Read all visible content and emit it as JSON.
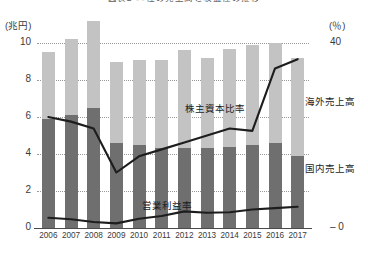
{
  "title": "図表2 ○○社の売上高と収益性の推移",
  "axes": {
    "left_unit": "(兆円)",
    "right_unit": "(％)",
    "left_ticks": [
      "10",
      "8",
      "6",
      "4",
      "2",
      "0"
    ],
    "right_ticks": [
      "40",
      "0"
    ],
    "left_range": [
      0,
      10
    ],
    "right_range": [
      0,
      40
    ]
  },
  "annotations": {
    "equity_ratio": "株主資本比率",
    "operating_margin": "営業利益率",
    "overseas_sales": "海外売上高",
    "domestic_sales": "国内売上高"
  },
  "colors": {
    "domestic_bar": "#6f6f6f",
    "overseas_bar": "#c3c3c3",
    "line": "#1d1d1d",
    "grid": "#9a9a9a",
    "axis": "#4a4a4a",
    "text": "#3a3a3a"
  },
  "chart_data": {
    "type": "bar",
    "title": "図表2 ○○社の売上高と収益性の推移",
    "xlabel": "",
    "ylabel": "兆円",
    "y2label": "％",
    "ylim": [
      0,
      10
    ],
    "y2lim": [
      0,
      40
    ],
    "grid": true,
    "legend": "inline-labels",
    "categories": [
      "2006",
      "2007",
      "2008",
      "2009",
      "2010",
      "2011",
      "2012",
      "2013",
      "2014",
      "2015",
      "2016",
      "2017"
    ],
    "series": [
      {
        "name": "国内売上高",
        "type": "bar",
        "stack": "sales",
        "axis": "left",
        "unit": "兆円",
        "color": "#6f6f6f",
        "values": [
          5.9,
          6.1,
          6.5,
          4.6,
          4.5,
          4.3,
          4.3,
          4.3,
          4.4,
          4.5,
          4.6,
          3.9
        ]
      },
      {
        "name": "海外売上高",
        "type": "bar",
        "stack": "sales",
        "axis": "left",
        "unit": "兆円",
        "color": "#c3c3c3",
        "values": [
          3.6,
          4.1,
          4.7,
          4.4,
          4.6,
          4.8,
          5.3,
          4.9,
          5.3,
          5.4,
          5.4,
          5.3
        ]
      },
      {
        "name": "株主資本比率",
        "type": "line",
        "axis": "right",
        "unit": "％",
        "color": "#1d1d1d",
        "values": [
          24.0,
          23.0,
          21.5,
          12.0,
          15.5,
          17.0,
          18.5,
          20.0,
          21.5,
          21.0,
          34.5,
          36.5
        ]
      },
      {
        "name": "営業利益率",
        "type": "line",
        "axis": "right",
        "unit": "％",
        "color": "#1d1d1d",
        "values": [
          2.2,
          1.9,
          1.3,
          1.0,
          2.0,
          2.6,
          3.6,
          3.3,
          3.4,
          4.0,
          4.3,
          4.6
        ]
      }
    ],
    "totals": [
      9.5,
      10.2,
      11.2,
      9.0,
      9.1,
      9.1,
      9.6,
      9.2,
      9.7,
      9.9,
      10.0,
      9.2
    ]
  }
}
